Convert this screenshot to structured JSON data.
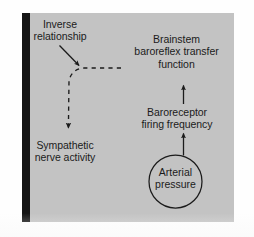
{
  "figure": {
    "type": "flow-diagram",
    "panel_color": "#c3c3c3",
    "ink_color": "#1b1b1b",
    "left_margin_bar_color": "#151515",
    "page_background": "#ffffff"
  },
  "nodes": {
    "inverse_relationship": {
      "label": "Inverse\nrelationship",
      "role": "annotation"
    },
    "brainstem": {
      "label": "Brainstem\nbaroreflex transfer\nfunction",
      "role": "process"
    },
    "baroreceptor": {
      "label": "Baroreceptor\nfiring frequency",
      "role": "signal"
    },
    "sympathetic": {
      "label": "Sympathetic\nnerve activity",
      "role": "output"
    },
    "arterial_pressure": {
      "label": "Arterial\npressure",
      "role": "source",
      "shape": "circle"
    }
  },
  "connectors": [
    {
      "name": "arterial-to-baroreceptor",
      "style": "solid-arrow",
      "direction": "up",
      "from": "arterial_pressure",
      "to": "baroreceptor"
    },
    {
      "name": "baroreceptor-to-brainstem",
      "style": "solid-arrow",
      "direction": "up",
      "from": "baroreceptor",
      "to": "brainstem"
    },
    {
      "name": "brainstem-to-sympathetic",
      "style": "dashed-arrow",
      "direction": "left-then-down",
      "from": "brainstem",
      "to": "sympathetic"
    },
    {
      "name": "inverse-relationship-pointer",
      "style": "solid-arrow",
      "direction": "down-right",
      "from": "inverse_relationship",
      "to": "brainstem-to-sympathetic"
    }
  ]
}
